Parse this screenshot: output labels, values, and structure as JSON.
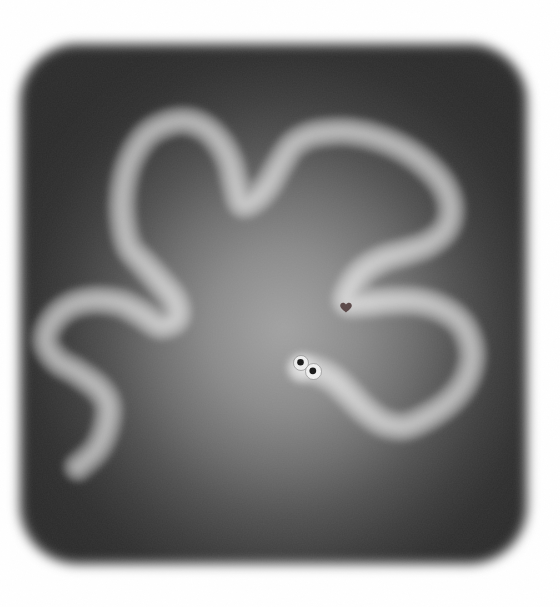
{
  "scene": {
    "page_background": "#ffffff",
    "arena": {
      "left": 20,
      "top": 44,
      "width": 507,
      "height": 520,
      "corner_radius": 58,
      "edge_blur_px": 6,
      "glow_center": "52% 55%",
      "glow_size": "290px 310px",
      "glow_stops": [
        "#a2a2a2 0%",
        "#989898 12%",
        "#8a8a8a 26%",
        "#6e6e6e 44%",
        "#515151 60%",
        "#3c3c3c 75%",
        "#2f2f2f 88%",
        "#2b2b2b 100%"
      ],
      "grain_opacity": 0.1
    },
    "worm": {
      "path_points": [
        [
          78,
          467
        ],
        [
          96,
          450
        ],
        [
          106,
          428
        ],
        [
          108,
          405
        ],
        [
          98,
          388
        ],
        [
          78,
          373
        ],
        [
          57,
          360
        ],
        [
          46,
          342
        ],
        [
          52,
          322
        ],
        [
          70,
          306
        ],
        [
          95,
          300
        ],
        [
          120,
          303
        ],
        [
          140,
          313
        ],
        [
          160,
          325
        ],
        [
          176,
          318
        ],
        [
          174,
          300
        ],
        [
          160,
          282
        ],
        [
          145,
          265
        ],
        [
          130,
          248
        ],
        [
          124,
          228
        ],
        [
          122,
          203
        ],
        [
          125,
          178
        ],
        [
          133,
          155
        ],
        [
          147,
          135
        ],
        [
          166,
          124
        ],
        [
          186,
          121
        ],
        [
          205,
          128
        ],
        [
          220,
          143
        ],
        [
          230,
          162
        ],
        [
          235,
          182
        ],
        [
          242,
          203
        ],
        [
          255,
          199
        ],
        [
          268,
          185
        ],
        [
          280,
          164
        ],
        [
          292,
          146
        ],
        [
          308,
          136
        ],
        [
          328,
          132
        ],
        [
          352,
          132
        ],
        [
          378,
          138
        ],
        [
          405,
          150
        ],
        [
          428,
          167
        ],
        [
          445,
          188
        ],
        [
          451,
          210
        ],
        [
          445,
          230
        ],
        [
          428,
          244
        ],
        [
          406,
          252
        ],
        [
          383,
          259
        ],
        [
          363,
          271
        ],
        [
          351,
          287
        ],
        [
          347,
          302
        ],
        [
          365,
          303
        ],
        [
          390,
          301
        ],
        [
          415,
          301
        ],
        [
          438,
          307
        ],
        [
          458,
          320
        ],
        [
          469,
          338
        ],
        [
          472,
          359
        ],
        [
          465,
          382
        ],
        [
          450,
          401
        ],
        [
          429,
          416
        ],
        [
          406,
          426
        ],
        [
          384,
          423
        ],
        [
          365,
          410
        ],
        [
          349,
          394
        ],
        [
          333,
          379
        ],
        [
          315,
          370
        ],
        [
          302,
          368
        ]
      ],
      "trail_layers": [
        {
          "width": 30,
          "color": "rgba(255,255,255,0.30)"
        },
        {
          "width": 19,
          "color": "rgba(255,255,255,0.27)"
        },
        {
          "width": 9,
          "color": "rgba(255,255,255,0.22)"
        }
      ],
      "trail_blur_px": 3,
      "head": {
        "x": 302,
        "y": 368,
        "glow_radius": 13,
        "glow_color": "rgba(255,255,255,0.35)"
      },
      "eyes": [
        {
          "name": "left",
          "cx": 301,
          "cy": 363,
          "r": 7.5,
          "white": "#ededed",
          "pupil_cx": 300.5,
          "pupil_cy": 362.2,
          "pupil_r": 3.3,
          "pupil_color": "#181818"
        },
        {
          "name": "right",
          "cx": 313.5,
          "cy": 371.5,
          "r": 8.0,
          "white": "#f0f0f0",
          "pupil_cx": 312.8,
          "pupil_cy": 370.8,
          "pupil_r": 3.4,
          "pupil_color": "#181818"
        }
      ],
      "eye_outline": "rgba(90,90,90,0.55)"
    },
    "heart": {
      "x": 346,
      "y": 307,
      "scale": 1.0,
      "color": "#4a3535",
      "opacity": 0.88,
      "path": "M0,-2.4 C-1.6,-5.4 -5.8,-4.8 -5.8,-1.4 C-5.8,1.2 -2.8,3.2 0,5.6 C2.8,3.2 5.8,1.2 5.8,-1.4 C5.8,-4.8 1.6,-5.4 0,-2.4 Z"
    }
  }
}
